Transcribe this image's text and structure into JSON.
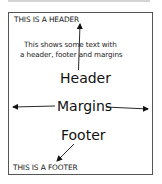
{
  "diagram": {
    "page_header_text": "THIS IS A HEADER",
    "page_footer_text": "THIS IS A FOOTER",
    "body_text": {
      "line1": "This shows some text with",
      "line2": "a header, footer and margins"
    },
    "labels": {
      "header": "Header",
      "margins": "Margins",
      "footer": "Footer"
    },
    "arrows": [
      {
        "name": "header-arrow",
        "from": "Header label",
        "to": "page header"
      },
      {
        "name": "margin-left-arrow",
        "from": "Margins label",
        "to": "left margin"
      },
      {
        "name": "margin-right-arrow",
        "from": "Margins label",
        "to": "right margin"
      },
      {
        "name": "footer-arrow",
        "from": "Footer label",
        "to": "page footer"
      }
    ],
    "colors": {
      "border": "#555555",
      "text": "#111111",
      "shadow": "#d4d4d4"
    }
  }
}
